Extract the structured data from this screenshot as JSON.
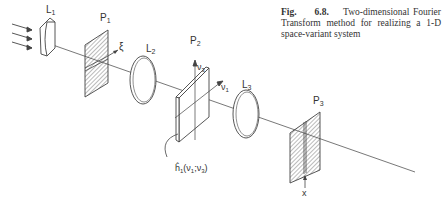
{
  "caption": {
    "fig_label": "Fig.",
    "fig_number": "6.8.",
    "text": "Two-dimensional Fourier Transform method for realizing a 1-D space-variant system"
  },
  "diagram": {
    "labels": {
      "lens1": "L1",
      "plane1": "P1",
      "xi_axis": "ξ",
      "lens2": "L2",
      "plane2": "P2",
      "nu3_axis": "ν3",
      "nu1_axis": "ν1",
      "lens3": "L3",
      "plane3": "P3",
      "x_axis": "x",
      "mask_function": "ĥ1(ν1;ν3)"
    },
    "colors": {
      "line": "#444444",
      "background": "#ffffff"
    }
  }
}
